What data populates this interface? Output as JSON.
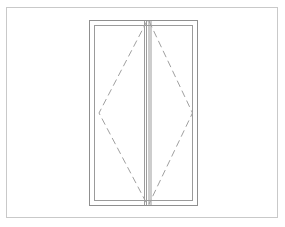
{
  "canvas": {
    "width": 285,
    "height": 227,
    "background_color": "#ffffff",
    "title": "Double-leaf window elevation"
  },
  "colors": {
    "page_border": "#c9c9c9",
    "frame_line": "#8f8f8f",
    "sash_line": "#9b9b9b",
    "mullion_line": "#9b9b9b",
    "opening_symbol": "#a0a0a0"
  },
  "page_border": {
    "label": "sheet-border",
    "x": 6.5,
    "y": 7.5,
    "width": 271,
    "height": 210,
    "stroke_width": 1
  },
  "window": {
    "label": "double-leaf-window",
    "outer_frame": {
      "label": "outer-frame",
      "x": 89.5,
      "y": 20.5,
      "width": 108,
      "height": 185,
      "stroke_width": 1
    },
    "inner_frame": {
      "label": "sash-frame",
      "x": 94.5,
      "y": 25.5,
      "width": 98,
      "height": 175,
      "stroke_width": 1
    },
    "mullion": {
      "label": "centre-meeting-stile",
      "lines_x": [
        144.5,
        146.5,
        149.0,
        151.0
      ],
      "y_top": 21.0,
      "y_bottom": 205.0,
      "stroke_width": 1
    },
    "leaves": [
      {
        "label": "left-leaf",
        "symbol": "tilt-turn-diamond",
        "apex_top": [
          147.0,
          21.0
        ],
        "apex_bottom": [
          147.0,
          204.0
        ],
        "vertex": [
          99.0,
          113.0
        ]
      },
      {
        "label": "right-leaf",
        "symbol": "tilt-turn-diamond",
        "apex_top": [
          149.0,
          21.0
        ],
        "apex_bottom": [
          149.0,
          204.0
        ],
        "vertex": [
          192.5,
          113.0
        ]
      }
    ],
    "opening_symbol": {
      "label": "opening-direction-symbol",
      "dash_pattern": "7 4",
      "stroke_width": 1
    }
  }
}
